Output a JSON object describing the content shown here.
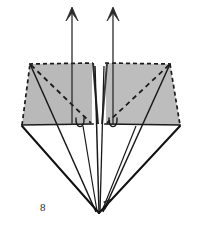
{
  "figure": {
    "kind": "origami-fold-diagram",
    "label": "8",
    "label_position": {
      "x": 40,
      "y": 201
    },
    "canvas": {
      "width": 200,
      "height": 226
    },
    "colors": {
      "background": "#ffffff",
      "panel_fill": "#b9b9b9",
      "panel_fill_right": "#bdbdbd",
      "stroke": "#1a1a1a",
      "stroke_soft": "#333333",
      "label": "#2b2b2b"
    },
    "strokes": {
      "solid_width": 1.6,
      "thin_width": 1.0,
      "dash_width": 1.7,
      "dash_pattern": "4 3"
    },
    "elements": {
      "left_panel": {
        "name": "left-shaded-panel",
        "points": "22,125 30,64 92,63 92,124",
        "filled": true
      },
      "right_panel": {
        "name": "right-shaded-panel",
        "points": "106,124 106,63 170,64 180,125",
        "filled": true
      },
      "left_panel_dashed_edges": [
        "22,125 30,64",
        "30,64 92,63"
      ],
      "right_panel_dashed_edges": [
        "106,63 170,64",
        "170,64 180,125"
      ],
      "left_panel_solid_edges": [
        "22,125 92,124"
      ],
      "right_panel_solid_edges": [
        "106,124 180,125"
      ],
      "left_diagonal_dashed": "30,64 92,124",
      "right_diagonal_dashed": "170,64 106,124",
      "left_diagonal_solid": "30,64 86,212",
      "right_diagonal_solid": "170,64 112,212",
      "center_fold_left": "92,63 98,212",
      "center_fold_right": "106,63 100,212",
      "center_notch_left": "92,63 97,122",
      "center_notch_right": "106,63 101,122",
      "diamond_left_edge": "22,125 99,213",
      "diamond_right_edge": "180,125 99,213",
      "apex": {
        "x": 99,
        "y": 213
      },
      "left_curl": {
        "cx": 79,
        "cy": 124,
        "rx": 4,
        "ry": 6
      },
      "right_curl": {
        "cx": 112,
        "cy": 124,
        "rx": 4,
        "ry": 6
      },
      "arrow_left": {
        "name": "left-up-arrow",
        "from": {
          "x": 72,
          "y": 124
        },
        "to": {
          "x": 72,
          "y": 6
        },
        "head": "72,6 66,20 72,15 78,20"
      },
      "arrow_right": {
        "name": "right-up-arrow",
        "from": {
          "x": 113,
          "y": 124
        },
        "to": {
          "x": 113,
          "y": 6
        },
        "head": "113,6 107,20 113,15 119,20"
      },
      "apex_small_arrow": {
        "name": "apex-rotation-arrowhead",
        "head": "104,199 111,204 106,205 108,210"
      }
    }
  }
}
